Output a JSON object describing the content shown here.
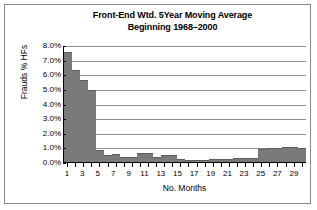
{
  "chart_data": {
    "type": "bar",
    "title": "Front-End Wtd. 5Year Moving Average",
    "subtitle": "Beginning 1968–2000",
    "xlabel": "No. Months",
    "ylabel": "Frauds % HFs",
    "grid": true,
    "legend": false,
    "ylim": [
      0,
      8
    ],
    "ytick_labels": [
      "8.0%",
      "7.0%",
      "6.0%",
      "5.0%",
      "4.0%",
      "3.0%",
      "2.0%",
      "1.0%",
      "0.0%"
    ],
    "ytick_values": [
      8,
      7,
      6,
      5,
      4,
      3,
      2,
      1,
      0
    ],
    "categories": [
      1,
      2,
      3,
      4,
      5,
      6,
      7,
      8,
      9,
      10,
      11,
      12,
      13,
      14,
      15,
      16,
      17,
      18,
      19,
      20,
      21,
      22,
      23,
      24,
      25,
      26,
      27,
      28,
      29,
      30
    ],
    "xtick_labels": [
      "1",
      "",
      "3",
      "",
      "5",
      "",
      "7",
      "",
      "9",
      "",
      "11",
      "",
      "13",
      "",
      "15",
      "",
      "17",
      "",
      "19",
      "",
      "21",
      "",
      "23",
      "",
      "25",
      "",
      "27",
      "",
      "29",
      ""
    ],
    "values": [
      7.5,
      6.3,
      5.6,
      4.9,
      0.85,
      0.5,
      0.55,
      0.35,
      0.35,
      0.6,
      0.6,
      0.35,
      0.5,
      0.5,
      0.2,
      0.15,
      0.15,
      0.15,
      0.2,
      0.2,
      0.2,
      0.25,
      0.25,
      0.25,
      0.9,
      0.95,
      0.95,
      1.0,
      1.05,
      0.95
    ],
    "bar_color": "#7a7a7a",
    "grid_color": "#8e8e8e",
    "axis_color": "#000000"
  }
}
